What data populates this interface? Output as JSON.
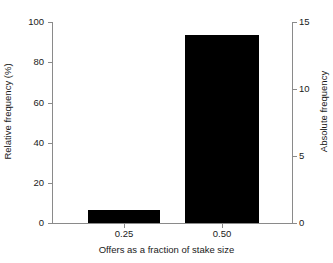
{
  "chart_data": {
    "type": "bar",
    "title": "",
    "xlabel": "Offers as a fraction of stake size",
    "ylabel": "Relative frequency (%)",
    "ylabel_secondary": "Absolute frequency",
    "categories": [
      "0.25",
      "0.50"
    ],
    "values": [
      6.7,
      93.3
    ],
    "values_secondary": [
      1,
      14
    ],
    "ylim": [
      0,
      100
    ],
    "ylim_secondary": [
      0,
      15
    ],
    "yticks": [
      0,
      20,
      40,
      60,
      80,
      100
    ],
    "yticks_secondary": [
      0,
      5,
      10,
      15
    ],
    "ytick_labels": [
      "0",
      "20",
      "40",
      "60",
      "80",
      "100"
    ],
    "ytick_labels_secondary": [
      "0",
      "5",
      "10",
      "15"
    ],
    "grid": false,
    "legend": false,
    "bar_color": "#000000",
    "axis_color": "#8a8a8a",
    "background": "#ffffff",
    "series": [
      {
        "name": "Offers",
        "values": [
          6.7,
          93.3
        ],
        "counts": [
          1,
          14
        ]
      }
    ]
  }
}
